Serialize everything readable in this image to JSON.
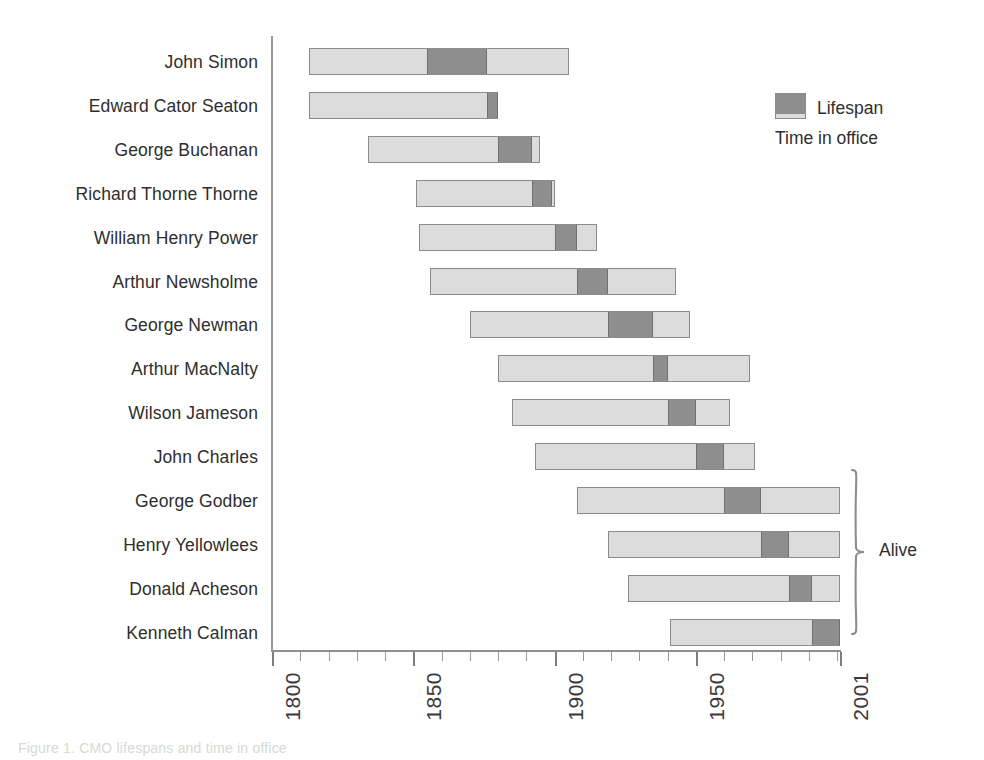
{
  "chart_data": {
    "type": "bar",
    "subtype": "horizontal-range-bar",
    "title": "",
    "xlabel": "",
    "ylabel": "",
    "xlim": [
      1800,
      2001
    ],
    "grid": false,
    "orientation": "horizontal",
    "axis": {
      "tick_labels": [
        "1800",
        "1850",
        "1900",
        "1950",
        "2001"
      ],
      "tick_values": [
        1800,
        1850,
        1900,
        1950,
        2001
      ],
      "minor_tick_step": 10,
      "tick_label_rotation": -90
    },
    "legend": {
      "position": "top-right",
      "entries": [
        {
          "label": "Lifespan",
          "color": "#dcdcdc"
        },
        {
          "label": "Time in office",
          "color": "#8e8e8e"
        }
      ]
    },
    "annotations": [
      {
        "label": "Alive",
        "type": "brace",
        "applies_to": [
          "George Godber",
          "Henry Yellowlees",
          "Donald Acheson",
          "Kenneth Calman"
        ]
      }
    ],
    "categories": [
      "John Simon",
      "Edward Cator Seaton",
      "George Buchanan",
      "Richard Thorne Thorne",
      "William Henry Power",
      "Arthur Newsholme",
      "George Newman",
      "Arthur MacNalty",
      "Wilson Jameson",
      "John Charles",
      "George Godber",
      "Henry Yellowlees",
      "Donald Acheson",
      "Kenneth Calman"
    ],
    "series": [
      {
        "name": "Lifespan",
        "color": "#dcdcdc",
        "spans": [
          {
            "start": 1813,
            "end": 1905
          },
          {
            "start": 1813,
            "end": 1880
          },
          {
            "start": 1834,
            "end": 1895
          },
          {
            "start": 1851,
            "end": 1900
          },
          {
            "start": 1852,
            "end": 1915
          },
          {
            "start": 1856,
            "end": 1943
          },
          {
            "start": 1870,
            "end": 1948
          },
          {
            "start": 1880,
            "end": 1969
          },
          {
            "start": 1885,
            "end": 1962
          },
          {
            "start": 1893,
            "end": 1971
          },
          {
            "start": 1908,
            "end": 2001
          },
          {
            "start": 1919,
            "end": 2001
          },
          {
            "start": 1926,
            "end": 2001
          },
          {
            "start": 1941,
            "end": 2001
          }
        ]
      },
      {
        "name": "Time in office",
        "color": "#8e8e8e",
        "spans": [
          {
            "start": 1855,
            "end": 1876
          },
          {
            "start": 1876,
            "end": 1880
          },
          {
            "start": 1880,
            "end": 1892
          },
          {
            "start": 1892,
            "end": 1899
          },
          {
            "start": 1900,
            "end": 1908
          },
          {
            "start": 1908,
            "end": 1919
          },
          {
            "start": 1919,
            "end": 1935
          },
          {
            "start": 1935,
            "end": 1940
          },
          {
            "start": 1940,
            "end": 1950
          },
          {
            "start": 1950,
            "end": 1960
          },
          {
            "start": 1960,
            "end": 1973
          },
          {
            "start": 1973,
            "end": 1983
          },
          {
            "start": 1983,
            "end": 1991
          },
          {
            "start": 1991,
            "end": 2001
          }
        ]
      }
    ]
  },
  "caption": {
    "text": "Figure 1. CMO lifespans and time in office"
  }
}
